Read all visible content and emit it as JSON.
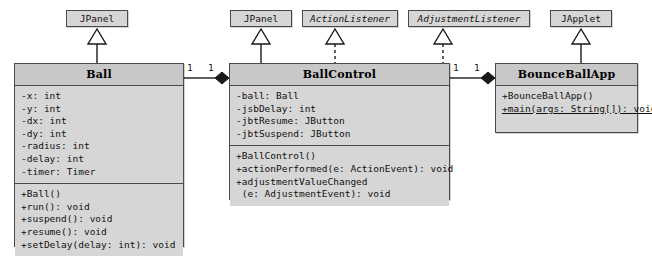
{
  "diagram": {
    "type": "uml-class-diagram",
    "colors": {
      "box_fill": "#d6d6d6",
      "header_fill": "#c8c8c8",
      "border": "#4a4a4a",
      "line": "#1a1a1a",
      "background": "#ffffff"
    }
  },
  "supertypes": [
    {
      "name": "JPanel",
      "stereotype": "class",
      "italic": false,
      "relation": "inheritance",
      "line_style": "solid",
      "target": "Ball"
    },
    {
      "name": "JPanel",
      "stereotype": "class",
      "italic": false,
      "relation": "inheritance",
      "line_style": "solid",
      "target": "BallControl"
    },
    {
      "name": "ActionListener",
      "stereotype": "interface",
      "italic": true,
      "relation": "realization",
      "line_style": "dashed",
      "target": "BallControl"
    },
    {
      "name": "AdjustmentListener",
      "stereotype": "interface",
      "italic": true,
      "relation": "realization",
      "line_style": "dashed",
      "target": "BallControl"
    },
    {
      "name": "JApplet",
      "stereotype": "class",
      "italic": false,
      "relation": "inheritance",
      "line_style": "solid",
      "target": "BounceBallApp"
    }
  ],
  "classes": [
    {
      "name": "Ball",
      "attributes": [
        "-x: int",
        "-y: int",
        "-dx: int",
        "-dy: int",
        "-radius: int",
        "-delay: int",
        "-timer: Timer"
      ],
      "methods": [
        {
          "text": "+Ball()",
          "static": false
        },
        {
          "text": "+run(): void",
          "static": false
        },
        {
          "text": "+suspend(): void",
          "static": false
        },
        {
          "text": "+resume(): void",
          "static": false
        },
        {
          "text": "+setDelay(delay: int): void",
          "static": false
        }
      ]
    },
    {
      "name": "BallControl",
      "attributes": [
        "-ball: Ball",
        "-jsbDelay: int",
        "-jbtResume: JButton",
        "-jbtSuspend: JButton"
      ],
      "methods": [
        {
          "text": "+BallControl()",
          "static": false
        },
        {
          "text": "+actionPerformed(e: ActionEvent): void",
          "static": false
        },
        {
          "text": "+adjustmentValueChanged",
          "static": false
        },
        {
          "text": " (e: AdjustmentEvent): void",
          "static": false
        }
      ]
    },
    {
      "name": "BounceBallApp",
      "attributes": [],
      "methods": [
        {
          "text": "+BounceBallApp()",
          "static": false
        },
        {
          "text": "+main(args: String[]): void",
          "static": true
        }
      ]
    }
  ],
  "associations": [
    {
      "from": "Ball",
      "to": "BallControl",
      "from_multiplicity": "1",
      "to_multiplicity": "1",
      "to_end": "composition-filled-diamond"
    },
    {
      "from": "BallControl",
      "to": "BounceBallApp",
      "from_multiplicity": "1",
      "to_multiplicity": "1",
      "to_end": "composition-filled-diamond"
    }
  ]
}
